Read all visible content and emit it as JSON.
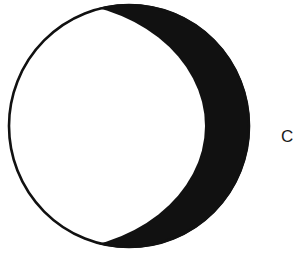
{
  "figure": {
    "label": "C",
    "caption_letter": "C",
    "background_color": "#ffffff",
    "ink_color": "#111111",
    "outline_color": "#111111",
    "shape_name": "crescent-moon",
    "geometry": {
      "outer_circle": {
        "center_x": 129,
        "center_y": 126,
        "radius_x": 121,
        "radius_y": 122,
        "stroke_width": 2.6
      },
      "terminator_circle": {
        "center_x": 46,
        "center_y": 126,
        "radius_x": 159,
        "radius_y": 125
      },
      "cusp_top": {
        "x": 140,
        "y": 5
      },
      "cusp_bottom": {
        "x": 140,
        "y": 247
      },
      "right_extreme_x": 250,
      "left_extreme_x": 8,
      "top_extreme_y": 4,
      "bottom_extreme_y": 249
    },
    "label_position": {
      "x": 283,
      "y": 129
    }
  },
  "canvas": {
    "width": 306,
    "height": 258
  }
}
